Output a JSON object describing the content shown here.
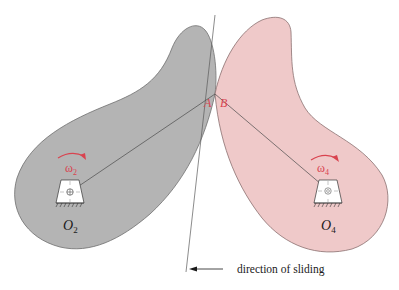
{
  "diagram": {
    "type": "cam-contact-mechanism",
    "colors": {
      "cam2_fill": "#b4b4b4",
      "cam2_stroke": "#6f6f6f",
      "cam4_fill": "#efc9c9",
      "cam4_stroke": "#8a7070",
      "accent_red": "#d9434f",
      "line": "#5a5a5a"
    },
    "labels": {
      "point_a": "A",
      "point_b": "B",
      "omega2_symbol": "ω",
      "omega2_sub": "2",
      "omega4_symbol": "ω",
      "omega4_sub": "4",
      "pivot2_letter": "O",
      "pivot2_sub": "2",
      "pivot4_letter": "O",
      "pivot4_sub": "4",
      "sliding_caption": "direction of sliding"
    },
    "bodies": [
      {
        "name": "cam-2",
        "pivot": "O2",
        "color": "gray",
        "rotation": "clockwise"
      },
      {
        "name": "cam-4",
        "pivot": "O4",
        "color": "pink",
        "rotation": "clockwise"
      }
    ],
    "contact_point": {
      "labels": [
        "A",
        "B"
      ]
    },
    "arrow": {
      "direction": "left",
      "meaning": "direction of sliding"
    }
  }
}
